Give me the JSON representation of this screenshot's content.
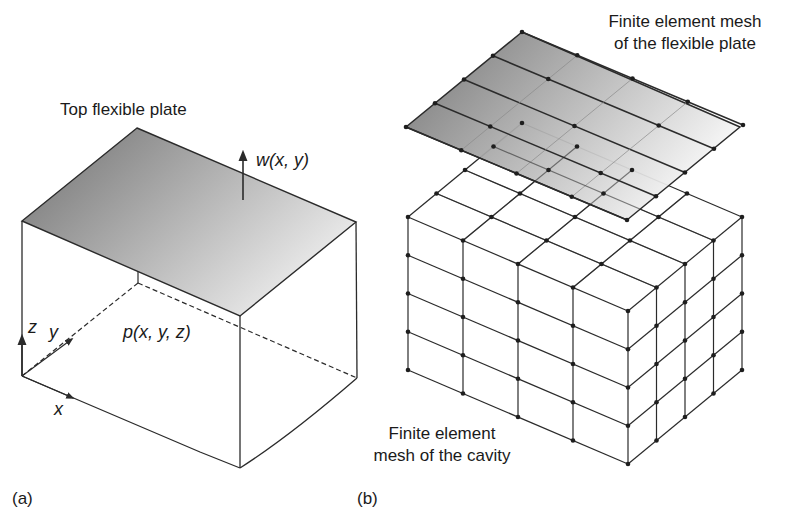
{
  "panel_a": {
    "label": "(a)",
    "plate_label": "Top flexible plate",
    "displacement_label": "w(x, y)",
    "pressure_label": "p(x, y, z)",
    "axes": {
      "x": "x",
      "y": "y",
      "z": "z"
    },
    "box": {
      "top_back": [
        137,
        128
      ],
      "top_left": [
        22,
        221
      ],
      "top_right": [
        356,
        222
      ],
      "top_front": [
        240,
        316
      ],
      "bottom_back": [
        138,
        283
      ],
      "bottom_left": [
        22,
        376
      ],
      "bottom_right": [
        357,
        378
      ],
      "bottom_front": [
        240,
        468
      ]
    },
    "plate_gradient": [
      "#6f6f6f",
      "#e9e9e9"
    ]
  },
  "panel_b": {
    "label": "(b)",
    "plate_mesh_label_line1": "Finite element mesh",
    "plate_mesh_label_line2": "of the flexible plate",
    "cavity_mesh_label_line1": "Finite element",
    "cavity_mesh_label_line2": "mesh of the cavity",
    "plate": {
      "top": [
        522,
        32
      ],
      "left": [
        406,
        127
      ],
      "right": [
        740,
        127
      ],
      "bottom": [
        627,
        220
      ],
      "divisions_u": 4,
      "divisions_v": 4
    },
    "cavity": {
      "top_back": [
        523,
        123
      ],
      "top_left": [
        408,
        217
      ],
      "top_right": [
        742,
        217
      ],
      "top_front": [
        628,
        311
      ],
      "height": 153,
      "divisions_x": 4,
      "divisions_y": 4,
      "divisions_z": 4
    },
    "plate_gradient": [
      "#6a6a6a",
      "#f2f2f2"
    ]
  },
  "colors": {
    "line": "#2b2b2b",
    "node": "#1e1e1e",
    "background": "#ffffff"
  }
}
